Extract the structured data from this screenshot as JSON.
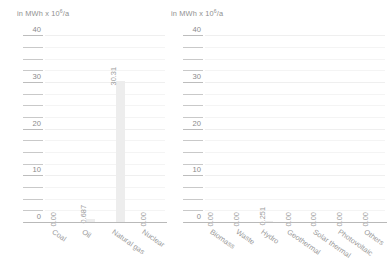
{
  "chart_data": [
    {
      "type": "bar",
      "title": "",
      "ylabel": "in MWh x 10^6/a",
      "ylabel_text": "in MWh x 10",
      "ylabel_sup": "6",
      "ylabel_tail": "/a",
      "xlabel": "",
      "categories": [
        "Coal",
        "Oil",
        "Natural gas",
        "Nuclear"
      ],
      "values": [
        0.0,
        0.687,
        30.31,
        0.0
      ],
      "value_labels": [
        "0.00",
        "0.687",
        "30.31",
        "0.00"
      ],
      "ylim": [
        0,
        42
      ],
      "yticks": [
        0,
        10,
        20,
        30,
        40
      ],
      "ytick_labels": [
        "0",
        "10",
        "20",
        "30",
        "40"
      ],
      "minor_tick_step": 2.5,
      "grid": true,
      "legend": "none",
      "bar_color": "#ededed"
    },
    {
      "type": "bar",
      "title": "",
      "ylabel": "in MWh x 10^6/a",
      "ylabel_text": "in MWh x 10",
      "ylabel_sup": "6",
      "ylabel_tail": "/a",
      "xlabel": "",
      "categories": [
        "Biomass",
        "Waste",
        "Hydro",
        "Geothermal",
        "Solar thermal",
        "Photovoltaic",
        "Others"
      ],
      "values": [
        0.0,
        0.0,
        0.251,
        0.0,
        0.0,
        0.0,
        0.0
      ],
      "value_labels": [
        "0.00",
        "0.00",
        "0.251",
        "0.00",
        "0.00",
        "0.00",
        "0.00"
      ],
      "ylim": [
        0,
        42
      ],
      "yticks": [
        0,
        10,
        20,
        30,
        40
      ],
      "ytick_labels": [
        "0",
        "10",
        "20",
        "30",
        "40"
      ],
      "minor_tick_step": 2.5,
      "grid": true,
      "legend": "none",
      "bar_color": "#ededed"
    }
  ]
}
